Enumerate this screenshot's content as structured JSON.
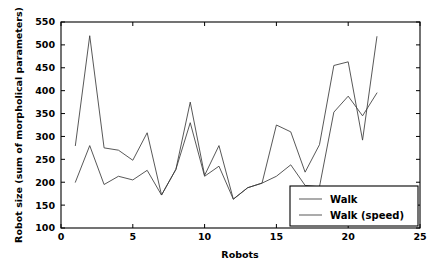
{
  "chart_data": {
    "type": "line",
    "title": "",
    "xlabel": "Robots",
    "ylabel": "Robot size (sum of morpholical parameters)",
    "xlim": [
      0,
      25
    ],
    "ylim": [
      100,
      550
    ],
    "xticks": [
      0,
      5,
      10,
      15,
      20,
      25
    ],
    "yticks": [
      100,
      150,
      200,
      250,
      300,
      350,
      400,
      450,
      500,
      550
    ],
    "xtick_labels": [
      "0",
      "5",
      "10",
      "15",
      "20",
      "25"
    ],
    "ytick_labels": [
      "100",
      "150",
      "200",
      "250",
      "300",
      "350",
      "400",
      "450",
      "500",
      "550"
    ],
    "grid": false,
    "legend_position": "lower right",
    "x": [
      1,
      2,
      3,
      4,
      5,
      6,
      7,
      8,
      9,
      10,
      11,
      12,
      13,
      14,
      15,
      16,
      17,
      18,
      19,
      20,
      21,
      22
    ],
    "series": [
      {
        "name": "Walk",
        "color": "#3a3a3a",
        "values": [
          200,
          280,
          195,
          213,
          205,
          226,
          172,
          228,
          330,
          213,
          235,
          163,
          188,
          198,
          213,
          238,
          193,
          190,
          353,
          388,
          345,
          395
        ]
      },
      {
        "name": "Walk (speed)",
        "color": "#3a3a3a",
        "values": [
          280,
          520,
          275,
          270,
          248,
          308,
          172,
          228,
          375,
          215,
          280,
          163,
          188,
          198,
          325,
          310,
          222,
          282,
          455,
          463,
          292,
          518
        ]
      }
    ]
  },
  "legend": {
    "entries": [
      {
        "label": "Walk"
      },
      {
        "label": "Walk (speed)"
      }
    ]
  }
}
